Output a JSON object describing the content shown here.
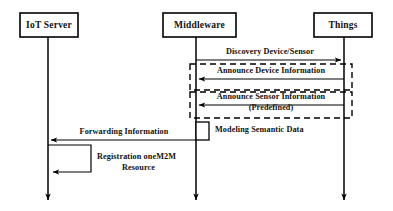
{
  "diagram": {
    "type": "uml-sequence-diagram",
    "width": 393,
    "height": 211,
    "background_color": "#ffffff",
    "line_color": "#000000",
    "text_color": "#111111"
  },
  "participants": [
    {
      "id": "iot-server",
      "label": "IoT Server",
      "lifeline_x": 48,
      "box": {
        "x": 20,
        "y": 13,
        "w": 58,
        "h": 24
      }
    },
    {
      "id": "middleware",
      "label": "Middleware",
      "lifeline_x": 196,
      "box": {
        "x": 163,
        "y": 13,
        "w": 73,
        "h": 24
      }
    },
    {
      "id": "things",
      "label": "Things",
      "lifeline_x": 344,
      "box": {
        "x": 314,
        "y": 13,
        "w": 58,
        "h": 24
      }
    }
  ],
  "messages": [
    {
      "id": "discovery-device-sensor",
      "label": "Discovery Device/Sensor",
      "from": "middleware",
      "to": "things",
      "direction": "right",
      "style": "solid",
      "y": 60,
      "label_y": 54
    },
    {
      "id": "announce-device-information",
      "label": "Announce Device Information",
      "from": "things",
      "to": "middleware",
      "direction": "left",
      "style": "solid",
      "y": 79,
      "label_y": 73
    },
    {
      "id": "announce-sensor-information",
      "label": "Announce Sensor Information",
      "label_line2": "(Predefined)",
      "from": "things",
      "to": "middleware",
      "direction": "left",
      "style": "solid",
      "y": 105,
      "label_y": 99,
      "label2_y": 110
    },
    {
      "id": "forwarding-information",
      "label": "Forwarding Information",
      "from": "middleware",
      "to": "iot-server",
      "direction": "left",
      "style": "solid",
      "y": 140,
      "label_y": 134
    }
  ],
  "fragments": [
    {
      "id": "announce-device-fragment",
      "x": 190,
      "y": 64,
      "w": 162,
      "h": 26
    },
    {
      "id": "announce-sensor-fragment",
      "x": 190,
      "y": 92,
      "w": 162,
      "h": 26
    }
  ],
  "activations": [
    {
      "id": "modeling-semantic-data-activation",
      "participant": "middleware",
      "label": "Modeling Semantic Data",
      "x": 196,
      "y": 122,
      "w": 13,
      "h": 18,
      "label_x": 215,
      "label_y": 132
    }
  ],
  "self_messages": [
    {
      "id": "registration-onem2m-resource",
      "participant": "iot-server",
      "label_line1": "Registration oneM2M",
      "label_line2": "Resource",
      "start_y": 145,
      "end_y": 172,
      "extent_x": 91,
      "label_x": 97,
      "label1_y": 159,
      "label2_y": 170
    }
  ],
  "lifelines": {
    "top_y": 37,
    "bottom_y": 203,
    "terminator": "arrowhead-down"
  }
}
